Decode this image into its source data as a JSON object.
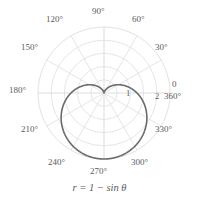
{
  "chart_data": {
    "type": "line",
    "subtype": "polar",
    "title": "",
    "caption": "r = 1 − sin θ",
    "equation": {
      "variable": "r",
      "equals": "=",
      "expression": "1 − sin θ"
    },
    "curve_name": "cardioid",
    "theta_unit": "degrees",
    "angular_ticks": [
      {
        "label": "0",
        "value": 0
      },
      {
        "label": "30°",
        "value": 30
      },
      {
        "label": "60°",
        "value": 60
      },
      {
        "label": "90°",
        "value": 90
      },
      {
        "label": "120°",
        "value": 120
      },
      {
        "label": "150°",
        "value": 150
      },
      {
        "label": "180°",
        "value": 180
      },
      {
        "label": "210°",
        "value": 210
      },
      {
        "label": "240°",
        "value": 240
      },
      {
        "label": "270°",
        "value": 270
      },
      {
        "label": "300°",
        "value": 300
      },
      {
        "label": "330°",
        "value": 330
      },
      {
        "label": "360°",
        "value": 360
      }
    ],
    "radial_ticks": [
      {
        "label": "1",
        "value": 1
      },
      {
        "label": "2",
        "value": 2
      }
    ],
    "rlim": [
      0,
      2
    ],
    "grid": true,
    "grid_circles": [
      0.4,
      0.8,
      1.2,
      1.6,
      2.0
    ],
    "grid_spokes_deg": [
      0,
      30,
      60,
      90,
      120,
      150,
      180,
      210,
      240,
      270,
      300,
      330
    ],
    "series": [
      {
        "name": "r = 1 - sin(theta)",
        "points_theta_deg": [
          0,
          15,
          30,
          45,
          60,
          75,
          90,
          105,
          120,
          135,
          150,
          165,
          180,
          195,
          210,
          225,
          240,
          255,
          270,
          285,
          300,
          315,
          330,
          345,
          360
        ],
        "points_r": [
          1.0,
          0.741,
          0.5,
          0.293,
          0.134,
          0.034,
          0.0,
          0.034,
          0.134,
          0.293,
          0.5,
          0.741,
          1.0,
          1.259,
          1.5,
          1.707,
          1.866,
          1.966,
          2.0,
          1.966,
          1.866,
          1.707,
          1.5,
          1.259,
          1.0
        ],
        "color": "#6b6b6b"
      }
    ],
    "colors": {
      "curve": "#6b6b6b",
      "grid": "#d8d8d8",
      "axis": "#cfcfcf",
      "text": "#5b5b5b",
      "background": "#ffffff"
    },
    "legend": null,
    "xlabel": "",
    "ylabel": ""
  },
  "labels": {
    "deg_0": "0",
    "deg_30": "30°",
    "deg_60": "60°",
    "deg_90": "90°",
    "deg_120": "120°",
    "deg_150": "150°",
    "deg_180": "180°",
    "deg_210": "210°",
    "deg_240": "240°",
    "deg_270": "270°",
    "deg_300": "300°",
    "deg_330": "330°",
    "deg_360": "360°",
    "r1": "1",
    "r2": "2",
    "caption": "r = 1 − sin θ"
  }
}
